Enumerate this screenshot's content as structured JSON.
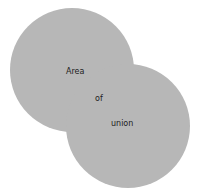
{
  "diagram": {
    "title": "Area of union",
    "labels": {
      "word1": "Area",
      "word2": "of",
      "word3": "union"
    },
    "shapes": [
      {
        "name": "circle-a",
        "cx": 72,
        "cy": 70,
        "r": 62
      },
      {
        "name": "circle-b",
        "cx": 128,
        "cy": 126,
        "r": 62
      }
    ],
    "colors": {
      "fill": "#b7b7b7",
      "background": "#ffffff",
      "text": "#222222"
    }
  }
}
